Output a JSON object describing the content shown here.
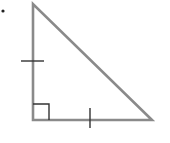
{
  "diagram": {
    "type": "right-isosceles-triangle",
    "stroke_color": "#8a8a8a",
    "tick_color": "#333333",
    "bullet_color": "#222222",
    "vertices": {
      "top": [
        33,
        4
      ],
      "bottom_left": [
        33,
        120
      ],
      "bottom_right": [
        152,
        120
      ]
    },
    "right_angle_marker": {
      "corner": "bottom_left",
      "size": 16
    },
    "congruence_ticks": [
      {
        "side": "left",
        "count": 1
      },
      {
        "side": "bottom",
        "count": 1
      }
    ],
    "bullet": true
  }
}
